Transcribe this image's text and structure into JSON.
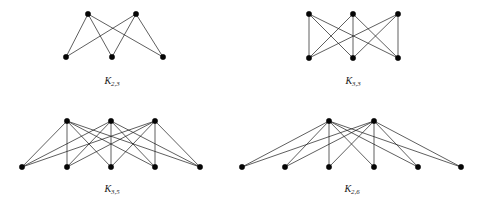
{
  "figure": {
    "background_color": "#ffffff",
    "vertex_color": "#050505",
    "edge_color": "#1a1a1a",
    "width": 479,
    "height": 205
  },
  "graphs": [
    {
      "id": "k23",
      "name": "K2,3",
      "caption_base": "K",
      "caption_sub": "2,3",
      "caption_x": 112,
      "caption_y": 84,
      "top_count": 2,
      "bottom_count": 3,
      "edge_count": 6,
      "top_vertices": [
        {
          "x": 88,
          "y": 14
        },
        {
          "x": 136,
          "y": 14
        }
      ],
      "bottom_vertices": [
        {
          "x": 66,
          "y": 57
        },
        {
          "x": 112,
          "y": 57
        },
        {
          "x": 163,
          "y": 57
        }
      ]
    },
    {
      "id": "k33",
      "name": "K3,3",
      "caption_base": "K",
      "caption_sub": "3,3",
      "caption_x": 353,
      "caption_y": 84,
      "top_count": 3,
      "bottom_count": 3,
      "edge_count": 9,
      "top_vertices": [
        {
          "x": 309,
          "y": 14
        },
        {
          "x": 353,
          "y": 14
        },
        {
          "x": 398,
          "y": 14
        }
      ],
      "bottom_vertices": [
        {
          "x": 309,
          "y": 58
        },
        {
          "x": 353,
          "y": 58
        },
        {
          "x": 398,
          "y": 58
        }
      ]
    },
    {
      "id": "k35",
      "name": "K3,5",
      "caption_base": "K",
      "caption_sub": "3,5",
      "caption_x": 112,
      "caption_y": 192,
      "top_count": 3,
      "bottom_count": 5,
      "edge_count": 15,
      "top_vertices": [
        {
          "x": 67,
          "y": 121
        },
        {
          "x": 111,
          "y": 121
        },
        {
          "x": 155,
          "y": 121
        }
      ],
      "bottom_vertices": [
        {
          "x": 22,
          "y": 167
        },
        {
          "x": 67,
          "y": 167
        },
        {
          "x": 111,
          "y": 167
        },
        {
          "x": 155,
          "y": 167
        },
        {
          "x": 200,
          "y": 167
        }
      ]
    },
    {
      "id": "k26",
      "name": "K2,6",
      "caption_base": "K",
      "caption_sub": "2,6",
      "caption_x": 352,
      "caption_y": 192,
      "top_count": 2,
      "bottom_count": 6,
      "edge_count": 12,
      "top_vertices": [
        {
          "x": 329,
          "y": 121
        },
        {
          "x": 374,
          "y": 121
        }
      ],
      "bottom_vertices": [
        {
          "x": 242,
          "y": 167
        },
        {
          "x": 285,
          "y": 167
        },
        {
          "x": 329,
          "y": 167
        },
        {
          "x": 374,
          "y": 167
        },
        {
          "x": 418,
          "y": 167
        },
        {
          "x": 461,
          "y": 167
        }
      ]
    }
  ]
}
